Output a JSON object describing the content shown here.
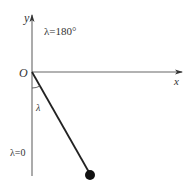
{
  "diagram": {
    "type": "pendulum-coordinate-diagram",
    "axes": {
      "x_label": "x",
      "y_label": "y",
      "origin_label": "O"
    },
    "labels": {
      "top_angle": "λ=180°",
      "bottom_angle": "λ=0",
      "angle_symbol": "λ"
    },
    "colors": {
      "axis": "#555555",
      "rod": "#222222",
      "bob": "#111111",
      "text": "#333333"
    }
  }
}
